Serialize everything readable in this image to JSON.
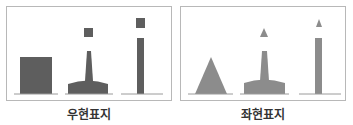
{
  "panels": [
    {
      "id": "right",
      "caption": "우현표지",
      "meaning": "starboard-mark",
      "topmark": "square",
      "color": "#5e5e5e",
      "marks": [
        "can-buoy",
        "pillar-buoy-square-topmark",
        "spar-buoy-square-topmark"
      ]
    },
    {
      "id": "left",
      "caption": "좌현표지",
      "meaning": "port-mark",
      "topmark": "triangle",
      "color": "#8c8c8c",
      "marks": [
        "cone-buoy",
        "pillar-buoy-triangle-topmark",
        "spar-buoy-triangle-topmark"
      ]
    }
  ],
  "line_color": "#9a9a9a",
  "frame_color": "#b8b8b8"
}
